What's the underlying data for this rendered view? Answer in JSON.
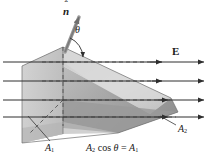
{
  "figure": {
    "caption": {
      "area2": "A",
      "area2_sub": "2",
      "cos": "cos",
      "theta": "θ",
      "equals": "=",
      "area1": "A",
      "area1_sub": "1",
      "full_text": "A₂ cos θ = A₁"
    },
    "labels": {
      "normal_vector": "n",
      "normal_hat": "ˆ",
      "angle": "θ",
      "field": "E",
      "area1": "A",
      "area1_sub": "1",
      "area2": "A",
      "area2_sub": "2"
    },
    "colors": {
      "background": "#ffffff",
      "stroke": "#2e2e2e",
      "dashed": "#555555",
      "surface_light": "#d9d9d9",
      "surface_mid": "#c4c4c4",
      "surface_dark": "#a8a8a8",
      "surface_darkest": "#8f8f8f",
      "text": "#1a1a1a"
    },
    "field_lines": {
      "count": 4,
      "direction": "left-to-right",
      "y_positions": [
        62,
        81,
        100,
        117
      ],
      "x_start": 2,
      "x_end": 205
    },
    "dashed_lines": {
      "count": 5,
      "description": "projection guides onto A1 plane"
    },
    "geometry": {
      "apex_x": 63,
      "apex_y": 47,
      "description": "Tilted plane A2 intersecting a vertical plane A1, with surface normal n-hat at angle theta to E field"
    }
  }
}
